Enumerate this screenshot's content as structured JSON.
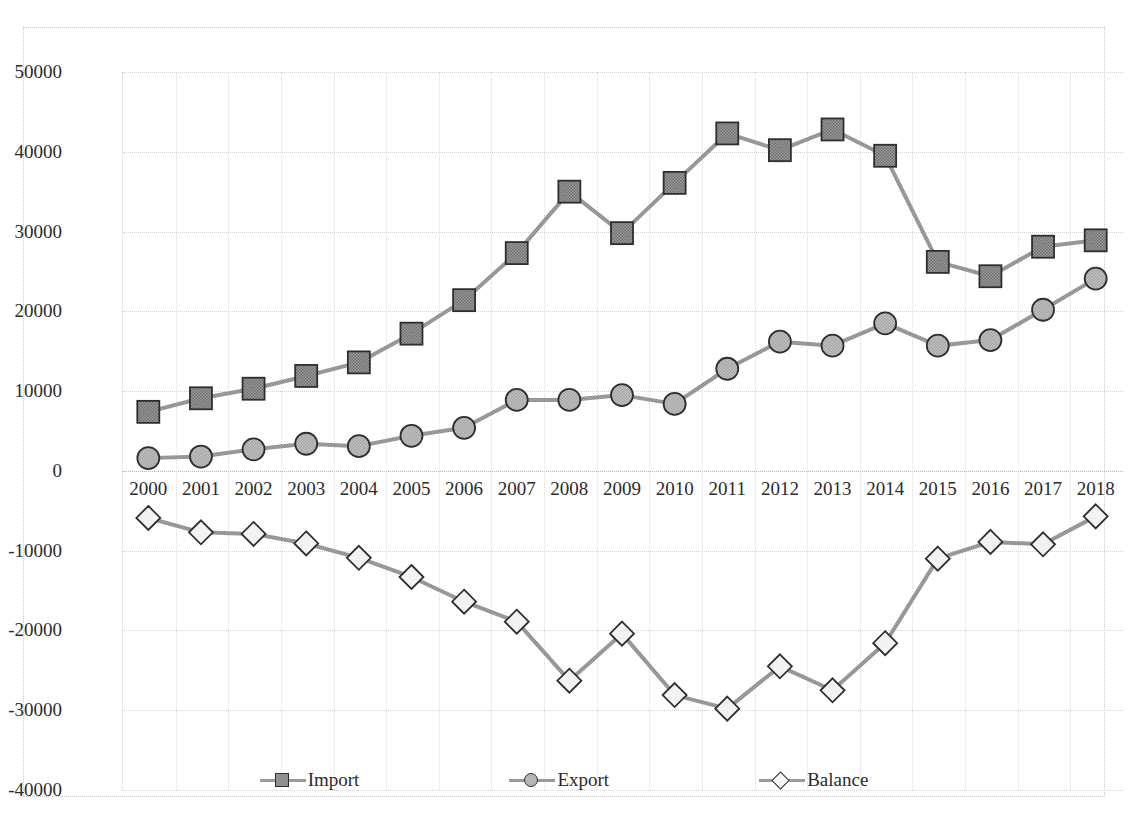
{
  "chart_data": {
    "type": "line",
    "xlabel": "",
    "ylabel": "",
    "ylim": [
      -40000,
      50000
    ],
    "ytick_step": 10000,
    "yticks": [
      "50000",
      "40000",
      "30000",
      "20000",
      "10000",
      "0",
      "-10000",
      "-20000",
      "-30000",
      "-40000"
    ],
    "ytick_values": [
      50000,
      40000,
      30000,
      20000,
      10000,
      0,
      -10000,
      -20000,
      -30000,
      -40000
    ],
    "grid": true,
    "legend_position": "bottom",
    "categories": [
      "2000",
      "2001",
      "2002",
      "2003",
      "2004",
      "2005",
      "2006",
      "2007",
      "2008",
      "2009",
      "2010",
      "2011",
      "2012",
      "2013",
      "2014",
      "2015",
      "2016",
      "2017",
      "2018"
    ],
    "series": [
      {
        "name": "Import",
        "marker": "square",
        "values": [
          7400,
          9100,
          10300,
          11900,
          13600,
          17200,
          21400,
          27300,
          35000,
          29800,
          36100,
          42300,
          40200,
          42800,
          39500,
          26200,
          24400,
          28100,
          28900
        ]
      },
      {
        "name": "Export",
        "marker": "circle",
        "values": [
          1600,
          1800,
          2700,
          3400,
          3100,
          4400,
          5400,
          8900,
          8900,
          9500,
          8400,
          12800,
          16200,
          15700,
          18500,
          15700,
          16400,
          20200,
          24100
        ]
      },
      {
        "name": "Balance",
        "marker": "diamond",
        "values": [
          -5900,
          -7700,
          -7900,
          -9100,
          -10900,
          -13300,
          -16400,
          -18900,
          -26300,
          -20400,
          -28100,
          -29800,
          -24500,
          -27500,
          -21600,
          -11000,
          -8900,
          -9200,
          -5700
        ]
      }
    ],
    "colors": {
      "line": "#9a9a9a",
      "marker_fill_import": "#8f8f8f",
      "marker_fill_export": "#b5b5b5",
      "marker_fill_balance": "#f2f2f2",
      "marker_stroke": "#2e2e2e",
      "grid": "#d3d3d3",
      "text": "#2b2b2b"
    }
  },
  "legend": {
    "items": [
      {
        "label": "Import",
        "marker": "square"
      },
      {
        "label": "Export",
        "marker": "circle"
      },
      {
        "label": "Balance",
        "marker": "diamond"
      }
    ]
  }
}
